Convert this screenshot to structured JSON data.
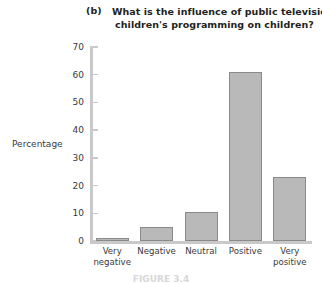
{
  "figure": {
    "panel_letter": "(b)",
    "caption": "FIGURE 3.4"
  },
  "chart_data": {
    "type": "bar",
    "title": "What is the influence of public television's children's programming on children?",
    "title_line1": "What is the influence of public television's",
    "title_line2": "children's programming on children?",
    "categories": [
      "Very negative",
      "Negative",
      "Neutral",
      "Positive",
      "Very positive"
    ],
    "category_lines": [
      [
        "Very",
        "negative"
      ],
      [
        "Negative"
      ],
      [
        "Neutral"
      ],
      [
        "Positive"
      ],
      [
        "Very",
        "positive"
      ]
    ],
    "values": [
      1,
      5,
      10.5,
      61,
      23
    ],
    "xlabel": "",
    "ylabel": "Percentage",
    "ylim": [
      0,
      70
    ],
    "yticks": [
      0,
      10,
      20,
      30,
      40,
      50,
      60,
      70
    ],
    "ytick_labels": [
      "0",
      "10",
      "20",
      "30",
      "40",
      "50",
      "60",
      "70"
    ],
    "grid": false,
    "legend": null,
    "bar_fill_color": "#b9b9b9",
    "bar_edge_color": "#8a8a8a",
    "axis_color": "#c9c9c9",
    "text_color": "#3a3a3a"
  }
}
